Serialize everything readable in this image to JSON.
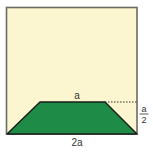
{
  "diagram": {
    "type": "geometry-figure",
    "colors": {
      "square_fill": "#FBF6CF",
      "square_border": "#6B6B63",
      "trapezoid_fill": "#1E8C46",
      "trapezoid_border": "#1A1A1A",
      "dotted_line": "#333333",
      "text": "#333333"
    },
    "labels": {
      "top_base": "a",
      "height_numerator": "a",
      "height_denominator": "2",
      "bottom_base": "2a"
    }
  }
}
